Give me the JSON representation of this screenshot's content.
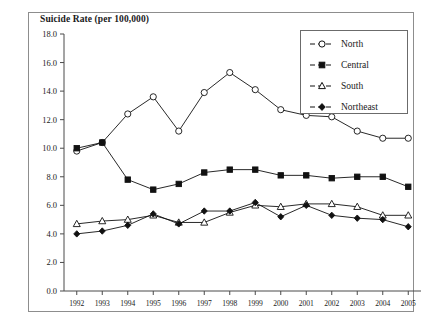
{
  "chart_data": {
    "type": "line",
    "title": "Suicide Rate (per 100,000)",
    "xlabel": "",
    "ylabel": "",
    "ylim": [
      0.0,
      18.0
    ],
    "yticks": [
      "0.0",
      "2.0",
      "4.0",
      "6.0",
      "8.0",
      "10.0",
      "12.0",
      "14.0",
      "16.0",
      "18.0"
    ],
    "ytick_step": 2.0,
    "grid": false,
    "legend_position": "upper-right",
    "categories": [
      "1992",
      "1993",
      "1994",
      "1995",
      "1996",
      "1997",
      "1998",
      "1999",
      "2000",
      "2001",
      "2002",
      "2003",
      "2004",
      "2005"
    ],
    "series": [
      {
        "name": "North",
        "marker": "open-circle",
        "values": [
          9.8,
          10.4,
          12.4,
          13.6,
          11.2,
          13.9,
          15.3,
          14.1,
          12.7,
          12.3,
          12.2,
          11.2,
          10.7,
          10.7
        ]
      },
      {
        "name": "Central",
        "marker": "filled-square",
        "values": [
          10.0,
          10.4,
          7.8,
          7.1,
          7.5,
          8.3,
          8.5,
          8.5,
          8.1,
          8.1,
          7.9,
          8.0,
          8.0,
          7.3
        ]
      },
      {
        "name": "South",
        "marker": "open-triangle",
        "values": [
          4.7,
          4.9,
          5.0,
          5.3,
          4.8,
          4.8,
          5.5,
          6.0,
          5.9,
          6.1,
          6.1,
          5.9,
          5.3,
          5.3
        ]
      },
      {
        "name": "Northeast",
        "marker": "filled-diamond",
        "values": [
          4.0,
          4.2,
          4.6,
          5.4,
          4.7,
          5.6,
          5.6,
          6.2,
          5.2,
          6.0,
          5.3,
          5.1,
          5.0,
          4.5
        ]
      }
    ]
  },
  "legend": {
    "items": [
      {
        "label": "North"
      },
      {
        "label": "Central"
      },
      {
        "label": "South"
      },
      {
        "label": "Northeast"
      }
    ]
  }
}
